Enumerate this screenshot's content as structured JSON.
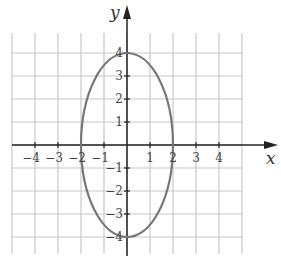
{
  "chart_data": {
    "type": "line",
    "title": "",
    "xlabel": "x",
    "ylabel": "y",
    "xlim": [
      -5,
      5
    ],
    "ylim": [
      -5,
      5
    ],
    "grid": true,
    "x_tick_labels": [
      "−4",
      "−3",
      "−2",
      "−1",
      "1",
      "2",
      "3",
      "4"
    ],
    "y_tick_labels": [
      "4",
      "3",
      "2",
      "1",
      "−1",
      "−2",
      "−3",
      "−4"
    ],
    "x_ticks": [
      -4,
      -3,
      -2,
      -1,
      1,
      2,
      3,
      4
    ],
    "y_ticks": [
      4,
      3,
      2,
      1,
      -1,
      -2,
      -3,
      -4
    ],
    "series": [
      {
        "name": "ellipse",
        "shape": "ellipse",
        "center": [
          0,
          0
        ],
        "x_radius": 2,
        "y_radius": 4,
        "equation": "x^2/4 + y^2/16 = 1",
        "key_points": [
          [
            2,
            0
          ],
          [
            0,
            4
          ],
          [
            -2,
            0
          ],
          [
            0,
            -4
          ]
        ]
      }
    ]
  },
  "colors": {
    "grid": "#c8c8c8",
    "axes": "#222222",
    "curve": "#777777"
  }
}
